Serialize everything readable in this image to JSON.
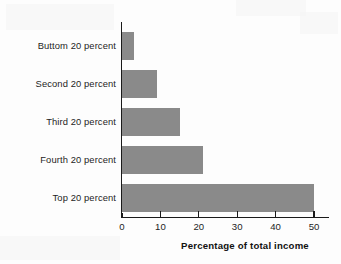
{
  "chart_data": {
    "type": "bar",
    "orientation": "horizontal",
    "title": "",
    "subtitle": "",
    "xlabel": "Percentage of total income",
    "ylabel": "",
    "categories": [
      "Buttom 20 percent",
      "Second 20 percent",
      "Third 20 percent",
      "Fourth 20 percent",
      "Top 20 percent"
    ],
    "values": [
      3,
      9,
      15,
      21,
      50
    ],
    "xticks": [
      0,
      10,
      20,
      30,
      40,
      50
    ],
    "xtick_labels": [
      "0",
      "10",
      "20",
      "30",
      "40",
      "50"
    ],
    "xlim": [
      0,
      50
    ],
    "grid": false,
    "legend": false,
    "legend_position": "none",
    "bar_color": "#8a8a8a",
    "bar_edge_color": "#8a8a8a",
    "axis_color": "#1a1a1a",
    "background_color": "#fdfdfd",
    "text_color": "#1d1d1d"
  },
  "axis": {
    "x_title": "Percentage of total income",
    "tick_0": "0",
    "tick_1": "10",
    "tick_2": "20",
    "tick_3": "30",
    "tick_4": "40",
    "tick_5": "50"
  },
  "categories": {
    "c0": "Buttom 20 percent",
    "c1": "Second 20 percent",
    "c2": "Third 20 percent",
    "c3": "Fourth 20 percent",
    "c4": "Top 20 percent"
  }
}
